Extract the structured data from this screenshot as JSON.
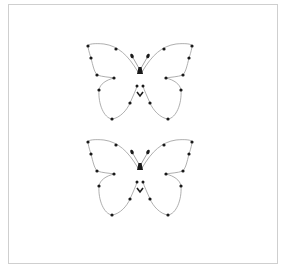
{
  "figure": {
    "frame": {
      "x": 8,
      "y": 4,
      "width": 270,
      "height": 260,
      "border_color": "#cfcfcf"
    },
    "stroke_color": "#9a9a9a",
    "point_color": "#1a1a1a",
    "butterflies": [
      {
        "name": "butterfly-top",
        "center_x": 140,
        "offset_y": 0
      },
      {
        "name": "butterfly-bottom",
        "center_x": 140,
        "offset_y": 96
      }
    ],
    "left_wing_points": [
      [
        88,
        46
      ],
      [
        116,
        49
      ],
      [
        91,
        58
      ],
      [
        97,
        75
      ],
      [
        114,
        78
      ],
      [
        99,
        90
      ],
      [
        130,
        103
      ],
      [
        112,
        119
      ]
    ],
    "body_points": [
      [
        132,
        56
      ],
      [
        148,
        56
      ],
      [
        140,
        71
      ],
      [
        137,
        86
      ],
      [
        143,
        86
      ],
      [
        140,
        95
      ]
    ]
  }
}
